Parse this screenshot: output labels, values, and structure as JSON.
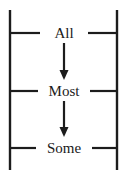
{
  "diagram": {
    "type": "hierarchy-scale",
    "title": "",
    "canvas": {
      "width": 128,
      "height": 177,
      "background": "#ffffff"
    },
    "stroke_color": "#1c1c1c",
    "text_color": "#1a1a1a",
    "rails": [
      {
        "name": "left-rail",
        "x": 10,
        "y1": 10,
        "y2": 170
      },
      {
        "name": "right-rail",
        "x": 117,
        "y1": 10,
        "y2": 170
      }
    ],
    "levels": [
      {
        "id": "all",
        "label": "All",
        "row_y": 33,
        "label_x": 64,
        "label_baseline": 38,
        "left_tick": {
          "x1": 10,
          "x2": 40,
          "y": 33
        },
        "right_tick": {
          "x1": 88,
          "x2": 117,
          "y": 33
        }
      },
      {
        "id": "most",
        "label": "Most",
        "row_y": 91,
        "label_x": 64,
        "label_baseline": 96,
        "left_tick": {
          "x1": 10,
          "x2": 38,
          "y": 91
        },
        "right_tick": {
          "x1": 90,
          "x2": 117,
          "y": 91
        }
      },
      {
        "id": "some",
        "label": "Some",
        "row_y": 148,
        "label_x": 64,
        "label_baseline": 153,
        "left_tick": {
          "x1": 10,
          "x2": 36,
          "y": 148
        },
        "right_tick": {
          "x1": 92,
          "x2": 117,
          "y": 148
        }
      }
    ],
    "arrows": [
      {
        "id": "arrow-all-to-most",
        "from": "all",
        "to": "most",
        "x": 64,
        "y_start": 43,
        "y_end": 80,
        "head_width": 9,
        "head_length": 10,
        "direction": "down"
      },
      {
        "id": "arrow-most-to-some",
        "from": "most",
        "to": "some",
        "x": 64,
        "y_start": 101,
        "y_end": 137,
        "head_width": 9,
        "head_length": 10,
        "direction": "down"
      }
    ]
  }
}
